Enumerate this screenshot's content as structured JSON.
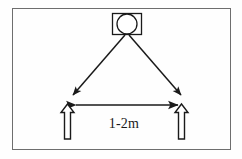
{
  "figure": {
    "frame": {
      "border_color": "#6e6e6e",
      "background_color": "#fefefe"
    },
    "sensor": {
      "name": "sensor-unit",
      "shape": "rectangle-with-circle",
      "label": ""
    },
    "beams": [
      {
        "name": "beam-left",
        "direction": "down-left",
        "style": "solid-arrow"
      },
      {
        "name": "beam-right",
        "direction": "down-right",
        "style": "solid-arrow"
      }
    ],
    "markers": [
      {
        "name": "marker-left",
        "shape": "hollow-up-arrow"
      },
      {
        "name": "marker-right",
        "shape": "hollow-up-arrow"
      }
    ],
    "dimension": {
      "label": "1-2m",
      "style": "double-headed-arrow",
      "line_color": "#1a1a1a"
    },
    "colors": {
      "stroke": "#1a1a1a",
      "frame": "#6e6e6e",
      "fill": "#ffffff"
    }
  }
}
